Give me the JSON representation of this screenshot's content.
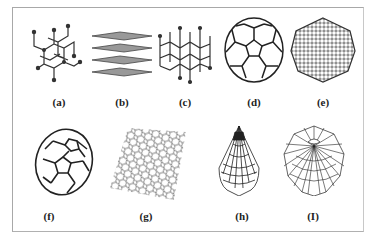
{
  "figure": {
    "panels": [
      {
        "id": "a",
        "label": "(a)",
        "structure": "diamond-lattice"
      },
      {
        "id": "b",
        "label": "(b)",
        "structure": "graphite-layers"
      },
      {
        "id": "c",
        "label": "(c)",
        "structure": "lonsdaleite-lattice"
      },
      {
        "id": "d",
        "label": "(d)",
        "structure": "c60-buckyball"
      },
      {
        "id": "e",
        "label": "(e)",
        "structure": "c540-fullerene"
      },
      {
        "id": "f",
        "label": "(f)",
        "structure": "c70-fullerene"
      },
      {
        "id": "g",
        "label": "(g)",
        "structure": "graphene-sheet"
      },
      {
        "id": "h",
        "label": "(h)",
        "structure": "nanocone-side"
      },
      {
        "id": "i",
        "label": "(I)",
        "structure": "nanocone-top"
      }
    ],
    "colors": {
      "line": "#2a2a2a",
      "border": "#a8a8a8",
      "background": "#ffffff"
    }
  }
}
